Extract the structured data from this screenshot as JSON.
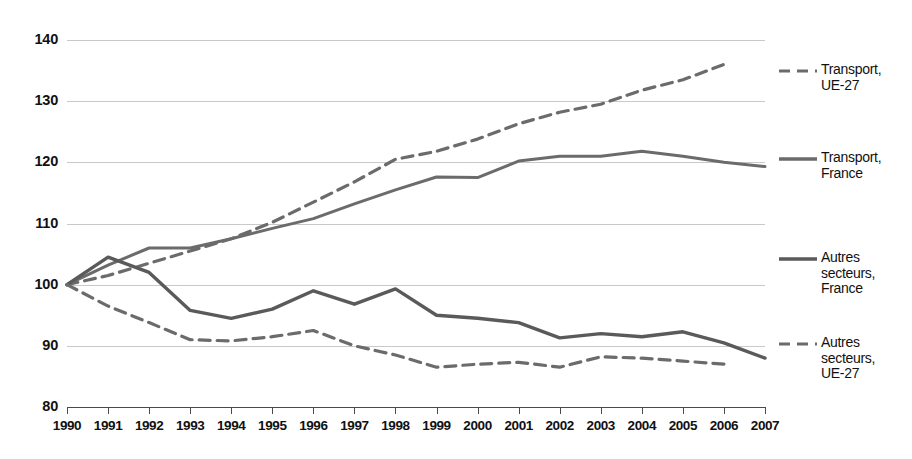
{
  "chart_data": {
    "type": "line",
    "title": "",
    "subtitle": "",
    "xlabel": "",
    "ylabel": "",
    "xlim": [
      1990,
      2007
    ],
    "ylim": [
      80,
      140
    ],
    "yticks": [
      80,
      90,
      100,
      110,
      120,
      130,
      140
    ],
    "grid": true,
    "legend_position": "right",
    "base_index": 100,
    "base_year": 1990,
    "x": [
      1990,
      1991,
      1992,
      1993,
      1994,
      1995,
      1996,
      1997,
      1998,
      1999,
      2000,
      2001,
      2002,
      2003,
      2004,
      2005,
      2006,
      2007
    ],
    "categories": [
      "1990",
      "1991",
      "1992",
      "1993",
      "1994",
      "1995",
      "1996",
      "1997",
      "1998",
      "1999",
      "2000",
      "2001",
      "2002",
      "2003",
      "2004",
      "2005",
      "2006",
      "2007"
    ],
    "series": [
      {
        "name": "Transport, UE-27",
        "style": "dashed",
        "color": "#6b6b6b",
        "width": 3.2,
        "values": [
          100,
          101.5,
          103.5,
          105.5,
          107.5,
          110.2,
          113.5,
          116.8,
          120.5,
          121.8,
          123.8,
          126.3,
          128.2,
          129.5,
          131.8,
          133.5,
          136.0,
          null
        ]
      },
      {
        "name": "Transport, France",
        "style": "solid",
        "color": "#6b6b6b",
        "width": 3.0,
        "values": [
          100,
          103.2,
          106.0,
          106.0,
          107.5,
          109.2,
          110.8,
          113.2,
          115.5,
          117.6,
          117.5,
          120.2,
          121.0,
          121.0,
          121.8,
          121.0,
          120.0,
          119.3
        ]
      },
      {
        "name": "Autres secteurs, France",
        "style": "solid",
        "color": "#5a5a5a",
        "width": 3.4,
        "values": [
          100,
          104.5,
          102.0,
          95.8,
          94.5,
          96.0,
          99.0,
          96.8,
          99.3,
          95.0,
          94.5,
          93.8,
          91.3,
          92.0,
          91.5,
          92.3,
          90.5,
          88.0
        ]
      },
      {
        "name": "Autres secteurs, UE-27",
        "style": "dashed",
        "color": "#6b6b6b",
        "width": 3.2,
        "values": [
          100,
          96.5,
          93.8,
          91.0,
          90.8,
          91.5,
          92.5,
          90.0,
          88.5,
          86.5,
          87.0,
          87.3,
          86.5,
          88.2,
          88.0,
          87.5,
          87.0,
          null
        ]
      }
    ]
  },
  "axes": {
    "y_tick_labels": [
      "140",
      "130",
      "120",
      "110",
      "100",
      "90",
      "80"
    ],
    "x_tick_labels": [
      "1990",
      "1991",
      "1992",
      "1993",
      "1994",
      "1995",
      "1996",
      "1997",
      "1998",
      "1999",
      "2000",
      "2001",
      "2002",
      "2003",
      "2004",
      "2005",
      "2006",
      "2007"
    ]
  },
  "legend": {
    "items": [
      {
        "label": "Transport,\nUE-27",
        "style": "dashed",
        "color": "#6b6b6b"
      },
      {
        "label": "Transport,\nFrance",
        "style": "solid",
        "color": "#6b6b6b"
      },
      {
        "label": "Autres\nsecteurs,\nFrance",
        "style": "solid",
        "color": "#5a5a5a"
      },
      {
        "label": "Autres\nsecteurs,\nUE-27",
        "style": "dashed",
        "color": "#6b6b6b"
      }
    ]
  },
  "colors": {
    "background": "#ffffff",
    "grid": "#c9c9c9",
    "axis": "#4a4a4a",
    "text": "#111111"
  }
}
